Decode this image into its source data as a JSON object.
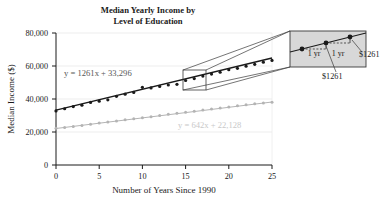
{
  "chart_data": {
    "type": "scatter",
    "title": "Median Yearly Income by Level of Education",
    "title_line1": "Median Yearly Income by",
    "title_line2": "Level of Education",
    "xlabel": "Number of Years Since 1990",
    "ylabel": "Median Income ($)",
    "xlim": [
      0,
      25
    ],
    "ylim": [
      0,
      80000
    ],
    "xticks": [
      0,
      5,
      10,
      15,
      20,
      25
    ],
    "xtick_labels": [
      "0",
      "5",
      "10",
      "15",
      "20",
      "25"
    ],
    "yticks": [
      0,
      20000,
      40000,
      60000,
      80000
    ],
    "ytick_labels": [
      "0",
      "20,000",
      "40,000",
      "60,000",
      "80,000"
    ],
    "grid": "horizontal-light",
    "legend_position": "none",
    "series": [
      {
        "name": "Bachelor's degree or higher",
        "color": "#1a1a1a",
        "equation": "y = 1261x + 33,296",
        "slope": 1261,
        "intercept": 33296,
        "x": [
          0,
          1,
          2,
          3,
          4,
          5,
          6,
          7,
          8,
          9,
          10,
          11,
          12,
          13,
          14,
          15,
          16,
          17,
          18,
          19,
          20,
          21,
          22,
          23,
          24,
          25
        ],
        "values": [
          32800,
          34100,
          35400,
          36200,
          37900,
          38700,
          39500,
          41600,
          42900,
          44000,
          47100,
          46700,
          47600,
          48500,
          48900,
          51200,
          52400,
          53900,
          55100,
          56200,
          57800,
          58600,
          59900,
          61000,
          62300,
          63400
        ]
      },
      {
        "name": "High school diploma",
        "color": "#b4b4b4",
        "equation": "y = 642x + 22,128",
        "slope": 642,
        "intercept": 22128,
        "x": [
          0,
          1,
          2,
          3,
          4,
          5,
          6,
          7,
          8,
          9,
          10,
          11,
          12,
          13,
          14,
          15,
          16,
          17,
          18,
          19,
          20,
          21,
          22,
          23,
          24,
          25
        ],
        "values": [
          22300,
          22800,
          23300,
          24000,
          24700,
          25400,
          26100,
          26700,
          27400,
          28000,
          28700,
          29300,
          30000,
          30700,
          31300,
          32000,
          32600,
          33300,
          33900,
          34600,
          35200,
          35900,
          36500,
          37100,
          37600,
          38100
        ]
      }
    ],
    "annotations": [
      {
        "name": "equation-upper",
        "text": "y = 1261x + 33,296",
        "color": "#575757"
      },
      {
        "name": "equation-lower",
        "text": "y = 642x + 22,128",
        "color": "#c9c9c9"
      },
      {
        "name": "callout-rise-label-left",
        "text": "1 yr"
      },
      {
        "name": "callout-rise-label-right",
        "text": "1 yr"
      },
      {
        "name": "callout-run-label-bottom",
        "text": "$1261"
      },
      {
        "name": "callout-run-label-right",
        "text": "$1261"
      }
    ]
  },
  "callout": {
    "yr_label_left": "1 yr",
    "yr_label_right": "1 yr",
    "money_label_bottom": "$1261",
    "money_label_right": "$1261"
  },
  "colors": {
    "series_upper": "#1a1a1a",
    "series_lower": "#b4b4b4",
    "gridline": "#e4e4e4",
    "axis": "#1a1a1a",
    "callout_fill": "#d8d8d8",
    "equation_upper": "#575757",
    "equation_lower": "#c9c9c9",
    "background": "#ffffff"
  }
}
